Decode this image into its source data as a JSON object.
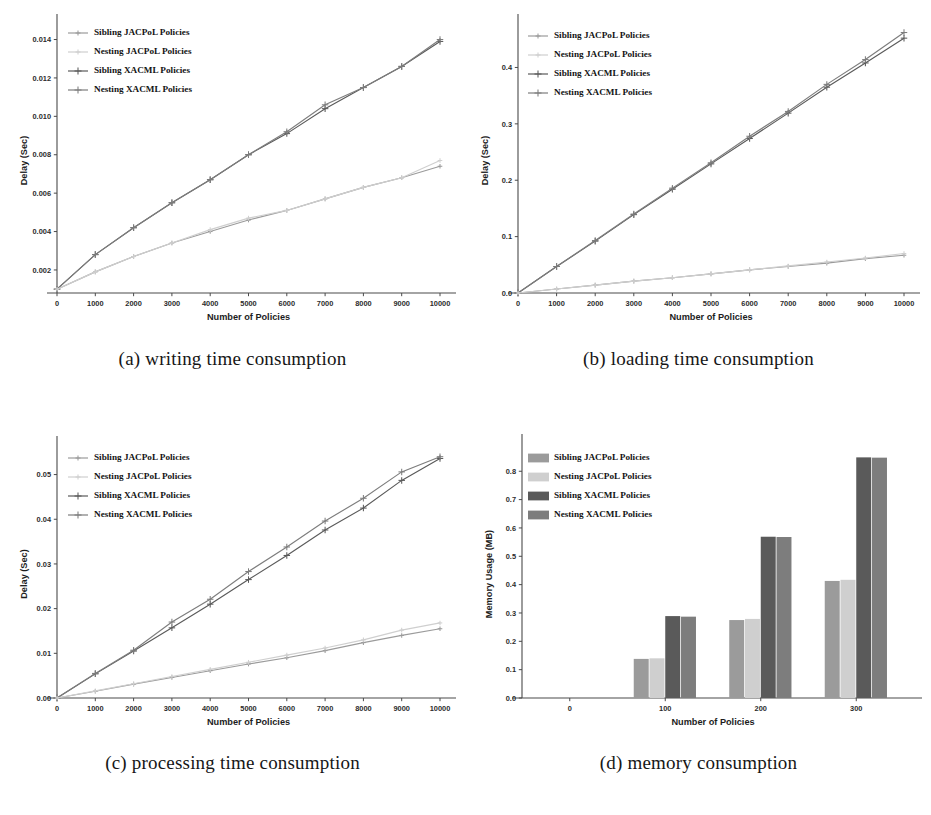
{
  "figure": {
    "series_names": [
      "Sibling JACPoL Policies",
      "Nesting JACPoL Policies",
      "Sibling XACML Policies",
      "Nesting XACML Policies"
    ],
    "series_colors": [
      "#9b9b9b",
      "#cfcfcf",
      "#5a5a5a",
      "#7d7d7d"
    ],
    "captions": {
      "a": "(a) writing time consumption",
      "b": "(b) loading time consumption",
      "c": "(c) processing time consumption",
      "d": "(d) memory consumption"
    }
  },
  "chart_data": [
    {
      "id": "a",
      "type": "line",
      "title": "(a) writing time consumption",
      "xlabel": "Number of Policies",
      "ylabel": "Delay (Sec)",
      "x": [
        0,
        1000,
        2000,
        3000,
        4000,
        5000,
        6000,
        7000,
        8000,
        9000,
        10000
      ],
      "xlim": [
        0,
        10000
      ],
      "ylim": [
        0.0008,
        0.0146
      ],
      "xticks": [
        0,
        1000,
        2000,
        3000,
        4000,
        5000,
        6000,
        7000,
        8000,
        9000,
        10000
      ],
      "xticklabels": [
        "0",
        "1000",
        "2000",
        "3000",
        "4000",
        "5000",
        "6000",
        "7000",
        "8000",
        "9000",
        "10000"
      ],
      "yticks": [
        0.002,
        0.004,
        0.006,
        0.008,
        0.01,
        0.012,
        0.014
      ],
      "yticklabels": [
        "0.002",
        "0.004",
        "0.006",
        "0.008",
        "0.010",
        "0.012",
        "0.014"
      ],
      "grid": false,
      "legend_position": "upper left",
      "series": [
        {
          "name": "Sibling JACPoL Policies",
          "values": [
            0.001,
            0.0019,
            0.0027,
            0.0034,
            0.004,
            0.0046,
            0.0051,
            0.0057,
            0.0063,
            0.0068,
            0.0074
          ]
        },
        {
          "name": "Nesting JACPoL Policies",
          "values": [
            0.001,
            0.0019,
            0.0027,
            0.0034,
            0.0041,
            0.0047,
            0.0051,
            0.0057,
            0.0063,
            0.0068,
            0.0077
          ]
        },
        {
          "name": "Sibling XACML Policies",
          "values": [
            0.001,
            0.0028,
            0.0042,
            0.0055,
            0.0067,
            0.008,
            0.0091,
            0.0104,
            0.0115,
            0.0126,
            0.0139
          ]
        },
        {
          "name": "Nesting XACML Policies",
          "values": [
            0.001,
            0.0028,
            0.0042,
            0.0055,
            0.0067,
            0.008,
            0.0092,
            0.0106,
            0.0115,
            0.0126,
            0.014
          ]
        }
      ]
    },
    {
      "id": "b",
      "type": "line",
      "title": "(b) loading time consumption",
      "xlabel": "Number of Policies",
      "ylabel": "Delay (Sec)",
      "x": [
        0,
        1000,
        2000,
        3000,
        4000,
        5000,
        6000,
        7000,
        8000,
        9000,
        10000
      ],
      "xlim": [
        0,
        10000
      ],
      "ylim": [
        0.0,
        0.47
      ],
      "xticks": [
        0,
        1000,
        2000,
        3000,
        4000,
        5000,
        6000,
        7000,
        8000,
        9000,
        10000
      ],
      "xticklabels": [
        "0",
        "1000",
        "2000",
        "3000",
        "4000",
        "5000",
        "6000",
        "7000",
        "8000",
        "9000",
        "10000"
      ],
      "yticks": [
        0.0,
        0.1,
        0.2,
        0.3,
        0.4
      ],
      "yticklabels": [
        "0.0",
        "0.1",
        "0.2",
        "0.3",
        "0.4"
      ],
      "grid": false,
      "legend_position": "upper left",
      "series": [
        {
          "name": "Sibling JACPoL Policies",
          "values": [
            0.0,
            0.007,
            0.014,
            0.021,
            0.027,
            0.034,
            0.041,
            0.047,
            0.053,
            0.061,
            0.067
          ]
        },
        {
          "name": "Nesting JACPoL Policies",
          "values": [
            0.0,
            0.007,
            0.014,
            0.021,
            0.027,
            0.034,
            0.041,
            0.048,
            0.055,
            0.062,
            0.07
          ]
        },
        {
          "name": "Sibling XACML Policies",
          "values": [
            0.0,
            0.047,
            0.092,
            0.139,
            0.184,
            0.229,
            0.274,
            0.319,
            0.365,
            0.408,
            0.452
          ]
        },
        {
          "name": "Nesting XACML Policies",
          "values": [
            0.0,
            0.047,
            0.093,
            0.14,
            0.186,
            0.231,
            0.278,
            0.322,
            0.37,
            0.414,
            0.462
          ]
        }
      ]
    },
    {
      "id": "c",
      "type": "line",
      "title": "(c) processing time consumption",
      "xlabel": "Number of Policies",
      "ylabel": "Delay (Sec)",
      "x": [
        0,
        1000,
        2000,
        3000,
        4000,
        5000,
        6000,
        7000,
        8000,
        9000,
        10000
      ],
      "xlim": [
        0,
        10000
      ],
      "ylim": [
        0.0,
        0.0555
      ],
      "xticks": [
        0,
        1000,
        2000,
        3000,
        4000,
        5000,
        6000,
        7000,
        8000,
        9000,
        10000
      ],
      "xticklabels": [
        "0",
        "1000",
        "2000",
        "3000",
        "4000",
        "5000",
        "6000",
        "7000",
        "8000",
        "9000",
        "10000"
      ],
      "yticks": [
        0.0,
        0.01,
        0.02,
        0.03,
        0.04,
        0.05
      ],
      "yticklabels": [
        "0.00",
        "0.01",
        "0.02",
        "0.03",
        "0.04",
        "0.05"
      ],
      "grid": false,
      "legend_position": "upper left",
      "series": [
        {
          "name": "Sibling JACPoL Policies",
          "values": [
            0.0,
            0.0015,
            0.0031,
            0.0046,
            0.0061,
            0.0076,
            0.009,
            0.0106,
            0.0124,
            0.014,
            0.0155
          ]
        },
        {
          "name": "Nesting JACPoL Policies",
          "values": [
            0.0,
            0.0016,
            0.0032,
            0.0048,
            0.0064,
            0.008,
            0.0096,
            0.0112,
            0.013,
            0.0152,
            0.0168
          ]
        },
        {
          "name": "Sibling XACML Policies",
          "values": [
            0.0,
            0.0054,
            0.0105,
            0.0157,
            0.021,
            0.0265,
            0.0319,
            0.0376,
            0.0425,
            0.0487,
            0.0536
          ]
        },
        {
          "name": "Nesting XACML Policies",
          "values": [
            0.0,
            0.0055,
            0.0107,
            0.017,
            0.0221,
            0.0283,
            0.0338,
            0.0396,
            0.0447,
            0.0506,
            0.054
          ]
        }
      ]
    },
    {
      "id": "d",
      "type": "bar",
      "title": "(d) memory consumption",
      "xlabel": "Number of Policies",
      "ylabel": "Memory Usage (MB)",
      "categories": [
        "0",
        "100",
        "200",
        "300"
      ],
      "xticklabels": [
        "0",
        "100",
        "200",
        "300"
      ],
      "ylim": [
        0.0,
        0.875
      ],
      "yticks": [
        0.0,
        0.1,
        0.2,
        0.3,
        0.4,
        0.5,
        0.6,
        0.7,
        0.8
      ],
      "yticklabels": [
        "0.0",
        "0.1",
        "0.2",
        "0.3",
        "0.4",
        "0.5",
        "0.6",
        "0.7",
        "0.8"
      ],
      "grid": false,
      "legend_position": "upper left",
      "series": [
        {
          "name": "Sibling JACPoL Policies",
          "values": [
            0.0,
            0.138,
            0.275,
            0.413
          ]
        },
        {
          "name": "Nesting JACPoL Policies",
          "values": [
            0.0,
            0.14,
            0.279,
            0.417
          ]
        },
        {
          "name": "Sibling XACML Policies",
          "values": [
            0.0,
            0.289,
            0.569,
            0.849
          ]
        },
        {
          "name": "Nesting XACML Policies",
          "values": [
            0.0,
            0.287,
            0.568,
            0.848
          ]
        }
      ]
    }
  ]
}
